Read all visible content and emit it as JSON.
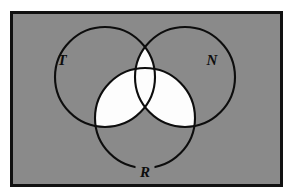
{
  "figure": {
    "kind": "venn-diagram",
    "page_background": "#ffffff",
    "frame": {
      "name": "diagram-frame",
      "x": 10,
      "y": 11,
      "width": 273,
      "height": 176,
      "fill": "#8a8a8a",
      "stroke": "#111111",
      "stroke_width": 3
    },
    "shading": {
      "region_description": "union of all pairwise intersections",
      "fill": "#fdfdfd",
      "stroke": "none"
    },
    "circle_style": {
      "stroke": "#0d0d0d",
      "stroke_width": 2.1,
      "fill": "none",
      "radius": 50
    },
    "sets": [
      {
        "id": "T",
        "label": "T",
        "name": "circle-t",
        "cx": 105,
        "cy": 77,
        "r": 50,
        "label_x": 62,
        "label_y": 65,
        "label_size": 15
      },
      {
        "id": "N",
        "label": "N",
        "name": "circle-n",
        "cx": 185,
        "cy": 77,
        "r": 50,
        "label_x": 212,
        "label_y": 65,
        "label_size": 15
      },
      {
        "id": "R",
        "label": "R",
        "name": "circle-r",
        "cx": 145,
        "cy": 118,
        "r": 50,
        "label_x": 145,
        "label_y": 177,
        "label_size": 15
      }
    ]
  }
}
